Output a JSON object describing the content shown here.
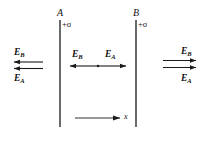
{
  "figure": {
    "background_color": "#ffffff",
    "stroke_color": "#1a1a1a"
  },
  "plates": [
    {
      "name": "A",
      "label": "A",
      "charge_label": "+σ",
      "x": 60,
      "y_top": 20,
      "y_bottom": 127
    },
    {
      "name": "B",
      "label": "B",
      "charge_label": "+σ",
      "x": 136,
      "y_top": 20,
      "y_bottom": 127
    }
  ],
  "regions": [
    {
      "name": "left-of-A",
      "labels": [
        {
          "text": "E",
          "sub": "B",
          "x": 14,
          "y": 48
        },
        {
          "text": "E",
          "sub": "A",
          "x": 14,
          "y": 74
        }
      ],
      "arrows": [
        {
          "name": "E_B",
          "direction": "left",
          "x1": 43,
          "y1": 62,
          "x2": 13,
          "y2": 62
        },
        {
          "name": "E_A",
          "direction": "left",
          "x1": 43,
          "y1": 68,
          "x2": 13,
          "y2": 68
        }
      ]
    },
    {
      "name": "between-A-and-B",
      "labels": [
        {
          "text": "E",
          "sub": "B",
          "x": 72,
          "y": 50
        },
        {
          "text": "E",
          "sub": "A",
          "x": 105,
          "y": 50
        }
      ],
      "arrows": [
        {
          "name": "E_B",
          "direction": "left",
          "x1": 98,
          "y1": 66,
          "x2": 69,
          "y2": 66
        },
        {
          "name": "E_A",
          "direction": "right",
          "x1": 98,
          "y1": 66,
          "x2": 127,
          "y2": 66
        }
      ]
    },
    {
      "name": "right-of-B",
      "labels": [
        {
          "text": "E",
          "sub": "B",
          "x": 181,
          "y": 47
        },
        {
          "text": "E",
          "sub": "A",
          "x": 181,
          "y": 74
        }
      ],
      "arrows": [
        {
          "name": "E_B",
          "direction": "right",
          "x1": 163,
          "y1": 60,
          "x2": 196,
          "y2": 60
        },
        {
          "name": "E_A",
          "direction": "right",
          "x1": 163,
          "y1": 67,
          "x2": 196,
          "y2": 67
        }
      ]
    }
  ],
  "axis": {
    "label": "x",
    "label_x": 124,
    "label_y": 115,
    "x1": 75,
    "y1": 118,
    "x2": 120,
    "y2": 118
  }
}
